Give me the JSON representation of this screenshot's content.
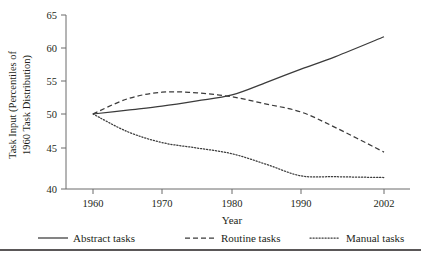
{
  "chart_data": {
    "type": "line",
    "title": "",
    "xlabel": "Year",
    "ylabel": "Task Input (Percentiles of 1960 Task Distribution)",
    "x": [
      1960,
      1970,
      1980,
      1990,
      2002
    ],
    "xtick_labels": [
      "1960",
      "1970",
      "1980",
      "1990",
      "2002"
    ],
    "ytick_labels": [
      "40",
      "45",
      "50",
      "55",
      "60",
      "65"
    ],
    "yticks": [
      40,
      45,
      50,
      55,
      60,
      65
    ],
    "ylim": [
      40,
      65
    ],
    "xlim": [
      1960,
      2002
    ],
    "grid": false,
    "legend_position": "bottom",
    "series": [
      {
        "name": "Abstract tasks",
        "style": "solid",
        "x": [
          1960,
          1965,
          1970,
          1975,
          1980,
          1985,
          1990,
          1995,
          2002
        ],
        "values": [
          50.0,
          50.6,
          51.2,
          52.0,
          52.9,
          54.8,
          56.8,
          58.7,
          61.7
        ]
      },
      {
        "name": "Routine tasks",
        "style": "dashed",
        "x": [
          1960,
          1965,
          1970,
          1975,
          1980,
          1985,
          1990,
          1995,
          2002
        ],
        "values": [
          50.0,
          52.3,
          53.3,
          53.2,
          52.6,
          51.5,
          50.3,
          48.0,
          44.5
        ]
      },
      {
        "name": "Manual tasks",
        "style": "dotted",
        "x": [
          1960,
          1965,
          1970,
          1975,
          1980,
          1985,
          1990,
          1995,
          2002
        ],
        "values": [
          50.0,
          47.4,
          45.8,
          45.0,
          44.3,
          43.0,
          41.6,
          41.5,
          41.4
        ]
      }
    ]
  },
  "axes": {
    "y_axis_title_line1": "Task Input (Percentiles of",
    "y_axis_title_line2": "1960 Task Distribution)",
    "x_axis_title": "Year",
    "ytick_0": "40",
    "ytick_1": "45",
    "ytick_2": "50",
    "ytick_3": "55",
    "ytick_4": "60",
    "ytick_5": "65",
    "xtick_0": "1960",
    "xtick_1": "1970",
    "xtick_2": "1980",
    "xtick_3": "1990",
    "xtick_4": "2002"
  },
  "legend": {
    "items": [
      {
        "label": "Abstract tasks",
        "style": "solid"
      },
      {
        "label": "Routine tasks",
        "style": "dashed"
      },
      {
        "label": "Manual tasks",
        "style": "dotted"
      }
    ]
  },
  "colors": {
    "line": "#3b3b3b",
    "axis": "#6b6b6b",
    "text": "#231f20",
    "background": "#ffffff"
  }
}
